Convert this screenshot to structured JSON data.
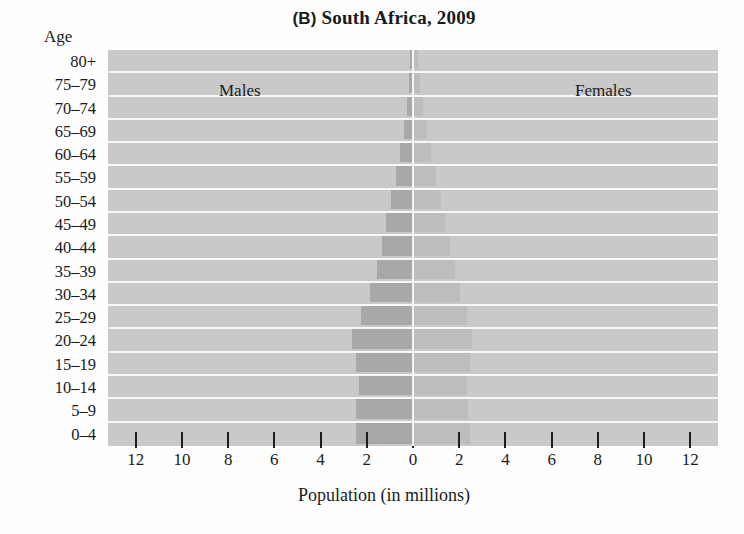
{
  "chart_data": {
    "type": "bar",
    "subtype": "population-pyramid",
    "title": "(B) South Africa, 2009",
    "panel_letter": "(B)",
    "title_rest": " South Africa, 2009",
    "axis_caption": "Age",
    "xlabel": "Population (in millions)",
    "ylabel": "Age",
    "grid": true,
    "legend_position": "inside-plot",
    "xlim": [
      -13.2,
      13.2
    ],
    "xticks_values": [
      -12,
      -10,
      -8,
      -6,
      -4,
      -2,
      0,
      2,
      4,
      6,
      8,
      10,
      12
    ],
    "xticks_labels": [
      "12",
      "10",
      "8",
      "6",
      "4",
      "2",
      "0",
      "2",
      "4",
      "6",
      "8",
      "10",
      "12"
    ],
    "categories": [
      "80+",
      "75–79",
      "70–74",
      "65–69",
      "60–64",
      "55–59",
      "50–54",
      "45–49",
      "40–44",
      "35–39",
      "30–34",
      "25–29",
      "20–24",
      "15–19",
      "10–14",
      "5–9",
      "0–4"
    ],
    "series": [
      {
        "name": "Males",
        "color": "#a8a8a8",
        "side": "left",
        "values": [
          0.12,
          0.18,
          0.25,
          0.38,
          0.55,
          0.72,
          0.95,
          1.15,
          1.35,
          1.55,
          1.85,
          2.25,
          2.65,
          2.45,
          2.35,
          2.45,
          2.45
        ]
      },
      {
        "name": "Females",
        "color": "#bdbdbd",
        "side": "right",
        "values": [
          0.22,
          0.3,
          0.42,
          0.6,
          0.8,
          1.0,
          1.2,
          1.4,
          1.6,
          1.8,
          2.05,
          2.35,
          2.55,
          2.45,
          2.35,
          2.4,
          2.45
        ]
      }
    ],
    "colors": {
      "plot_background": "#c9c9c9",
      "gridline": "#f7f7f7",
      "zero_line": "#f5f5f5",
      "male_bar": "#a8a8a8",
      "female_bar": "#bdbdbd",
      "text": "#1a1a1a",
      "page_background": "#fefefe"
    }
  }
}
